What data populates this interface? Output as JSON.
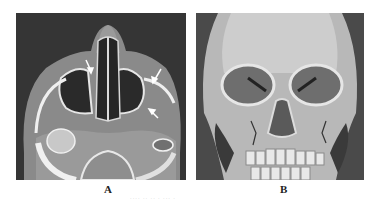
{
  "figure": {
    "panels": [
      {
        "id": "A",
        "label": "A",
        "description": "Axial CT scan (bone window) of the maxillary sinuses and nasal cavity with white arrows indicating fractures"
      },
      {
        "id": "B",
        "label": "B",
        "description": "3D CT reconstruction of the skull, frontal view, showing facial fractures"
      }
    ],
    "caption_partial": "···· ·· ·· · ··· ·"
  },
  "colors": {
    "background": "#ffffff",
    "ct_dark": "#3a3a3a",
    "bone": "#e6e6e6",
    "arrow": "#ffffff"
  }
}
